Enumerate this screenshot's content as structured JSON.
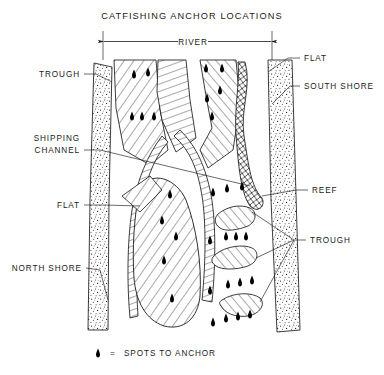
{
  "title": "CATFISHING ANCHOR LOCATIONS",
  "dimension": {
    "river_label": "RIVER"
  },
  "legend": {
    "symbol": "anchor-spot-marker",
    "equals": "=",
    "text": "SPOTS TO ANCHOR"
  },
  "labels": {
    "trough_top_left": "TROUGH",
    "shipping_channel_line1": "SHIPPING",
    "shipping_channel_line2": "CHANNEL",
    "flat_left": "FLAT",
    "north_shore": "NORTH  SHORE",
    "flat_right": "FLAT",
    "south_shore": "SOUTH  SHORE",
    "reef": "REEF",
    "trough_right": "TROUGH"
  },
  "colors": {
    "ink": "#1a1a1a",
    "paper": "#ffffff",
    "anchor": "#000000"
  },
  "features": {
    "shores": [
      "north-shore-band",
      "south-shore-band"
    ],
    "fills": [
      "stipple",
      "diagonal-hatch",
      "cross-hatch",
      "ladder-hatch"
    ],
    "anchor_spot_count": 33
  }
}
